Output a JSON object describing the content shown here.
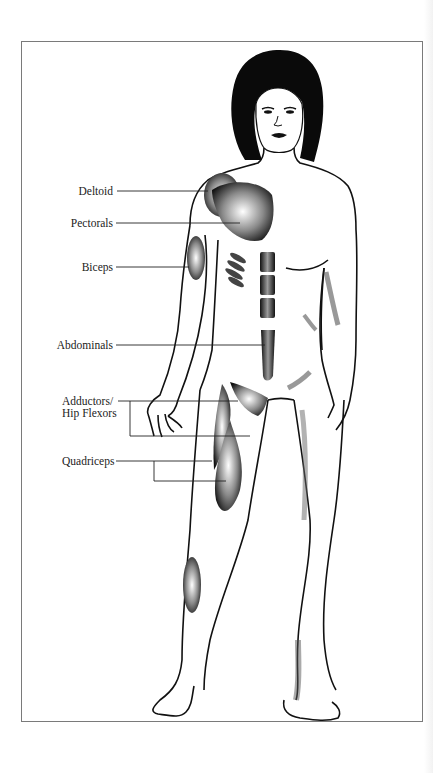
{
  "figure": {
    "title": "",
    "colors": {
      "outline": "#111111",
      "hair": "#0a0a0a",
      "frame": "#7a7a7a",
      "shading": "#3a3a3a",
      "background": "#ffffff"
    }
  },
  "labels": [
    {
      "id": "deltoid",
      "text": "Deltoid"
    },
    {
      "id": "pectorals",
      "text": "Pectorals"
    },
    {
      "id": "biceps",
      "text": "Biceps"
    },
    {
      "id": "abdominals",
      "text": "Abdominals"
    },
    {
      "id": "adductors",
      "line1": "Adductors/",
      "line2": "Hip Flexors"
    },
    {
      "id": "quadriceps",
      "text": "Quadriceps"
    }
  ]
}
